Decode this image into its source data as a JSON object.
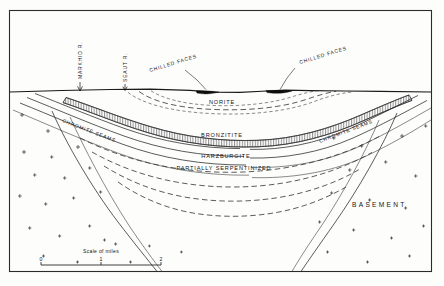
{
  "figure": {
    "title_implicit": "Geological cross-section of a layered igneous intrusion",
    "frame": {
      "x": 9,
      "y": 10,
      "width": 423,
      "height": 262
    }
  },
  "labels": {
    "river_left": "MARKHID R.",
    "river_right": "SEAUT R.",
    "chilled_faces_left": "CHILLED FACES",
    "chilled_faces_right": "CHILLED FACES",
    "norite": "NORITE",
    "bronzitite": "BRONZITITE",
    "harzburgite": "HARZBURGITE",
    "partially_serpentinized": "PARTIALLY  SERPENTINIZED",
    "chromite_seams_left": "CHROMITE SEAMS",
    "chromite_seams_right": "CHROMITE SEAMS",
    "basement": "BASEMENT"
  },
  "scale": {
    "caption": "Scale of miles",
    "ticks": [
      "0",
      "1",
      "2"
    ],
    "x_start": 41,
    "x_end": 161,
    "y": 265
  },
  "colors": {
    "ink": "#1a1a1a",
    "lens_fill": "#0d0d0d",
    "paper": "#fdfdfc",
    "frame": "#2b2b2b"
  }
}
